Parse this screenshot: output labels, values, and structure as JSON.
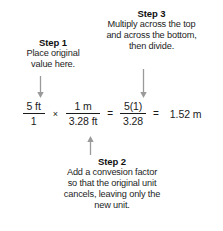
{
  "diagram": {
    "background_color": "#ffffff",
    "text_color": "#1b1b1b",
    "arrow_color": "#9a9a9a"
  },
  "steps": [
    {
      "id": "step1",
      "title": "Step 1",
      "body": "Place original value here.",
      "lines": [
        "Place original",
        "value here."
      ],
      "arrow": "down-arrow-icon"
    },
    {
      "id": "step3",
      "title": "Step 3",
      "body": "Multiply across the top and across the bottom, then divide.",
      "lines": [
        "Multiply across the top",
        "and across the bottom,",
        "then divide."
      ],
      "arrow": "down-arrow-icon"
    },
    {
      "id": "step2",
      "title": "Step 2",
      "body": "Add a convesion factor so that the original unit cancels, leaving only the new unit.",
      "lines": [
        "Add a convesion factor",
        "so that the original unit",
        "cancels, leaving only the",
        "new unit."
      ],
      "arrow": "up-arrow-icon"
    }
  ],
  "equation": {
    "fraction1": {
      "numerator": "5 ft",
      "denominator": "1"
    },
    "operator1": "×",
    "fraction2": {
      "numerator": "1 m",
      "denominator": "3.28 ft"
    },
    "operator2": "=",
    "fraction3": {
      "numerator": "5(1)",
      "denominator": "3.28"
    },
    "operator3": "=",
    "result": "1.52 m"
  }
}
